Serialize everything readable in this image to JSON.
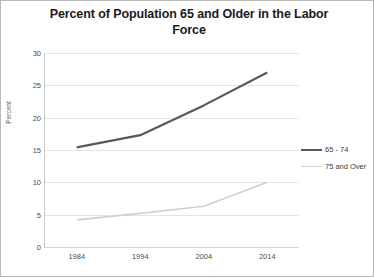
{
  "chart_data": {
    "type": "line",
    "title": "Percent of Population 65 and Older in the Labor Force",
    "title_line1": "Percent of Population 65 and Older in the Labor",
    "title_line2": "Force",
    "xlabel": "",
    "ylabel": "Percent",
    "categories": [
      "1984",
      "1994",
      "2004",
      "2014"
    ],
    "x": [
      1984,
      1994,
      2004,
      2014
    ],
    "ylim": [
      0,
      30
    ],
    "ytick_labels": [
      "0",
      "5",
      "10",
      "15",
      "20",
      "25",
      "30"
    ],
    "ytick_values": [
      0,
      5,
      10,
      15,
      20,
      25,
      30
    ],
    "grid": true,
    "legend_position": "right",
    "series": [
      {
        "name": "65 - 74",
        "values": [
          15.4,
          17.3,
          21.9,
          27.0
        ],
        "color": "#595959",
        "width": 2.2
      },
      {
        "name": "75 and Over",
        "values": [
          4.2,
          5.2,
          6.3,
          10.0
        ],
        "color": "#d0d0d0",
        "width": 1.6
      }
    ]
  },
  "colors": {
    "frame_border": "#b9b9b9",
    "gridline": "#e4e4e4",
    "axis": "#c8c8c8",
    "text": "#4a4a4a",
    "title": "#1a1a1a"
  }
}
